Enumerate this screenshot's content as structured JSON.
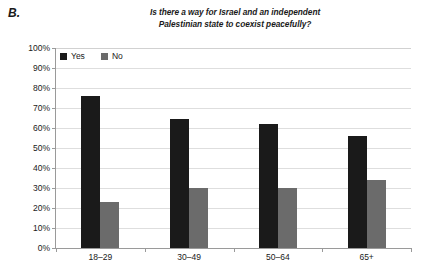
{
  "panel": {
    "label": "B."
  },
  "chart_data": {
    "type": "bar",
    "title": "Is there a way for Israel and an independent Palestinian state to coexist peacefully?",
    "title_lines": [
      "Is there a way for Israel and an independent",
      "Palestinian state to coexist peacefully?"
    ],
    "xlabel": "",
    "ylabel": "",
    "ylim": [
      0,
      100
    ],
    "ytick_labels": [
      "0%",
      "10%",
      "20%",
      "30%",
      "40%",
      "50%",
      "60%",
      "70%",
      "80%",
      "90%",
      "100%"
    ],
    "ytick_values": [
      0,
      10,
      20,
      30,
      40,
      50,
      60,
      70,
      80,
      90,
      100
    ],
    "categories": [
      "18–29",
      "30–49",
      "50–64",
      "65+"
    ],
    "series": [
      {
        "name": "Yes",
        "color": "#1a1a1a",
        "values": [
          76,
          64.5,
          62,
          56
        ]
      },
      {
        "name": "No",
        "color": "#6b6b6b",
        "values": [
          23,
          30,
          30,
          34
        ]
      }
    ],
    "legend_position": "top-left-inside",
    "grid": true,
    "grid_axis": "y"
  }
}
